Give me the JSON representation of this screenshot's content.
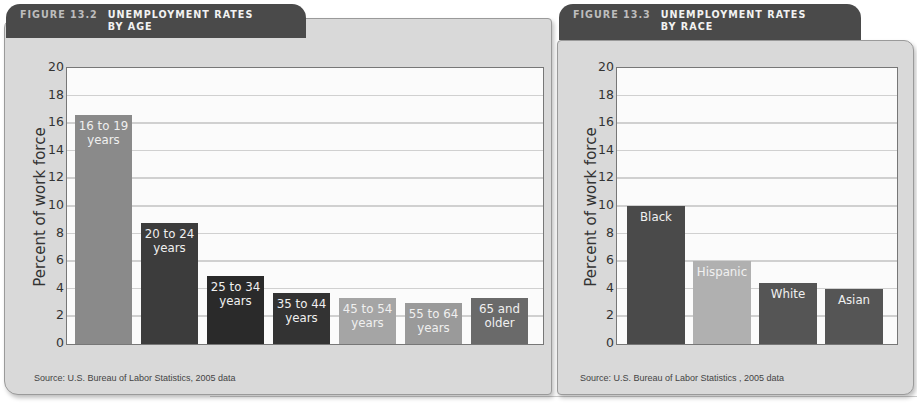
{
  "chart_data": [
    {
      "type": "bar",
      "title": "FIGURE 13.2  UNEMPLOYMENT RATES BY AGE",
      "figure_label": "FIGURE 13.2",
      "title_line1": "UNEMPLOYMENT RATES",
      "title_line2": "BY AGE",
      "xlabel": "",
      "ylabel": "Percent of work force",
      "ylim": [
        0,
        20
      ],
      "yticks": [
        "0",
        "2",
        "4",
        "6",
        "8",
        "10",
        "12",
        "14",
        "16",
        "18",
        "20"
      ],
      "grid": true,
      "categories": [
        "16 to 19 years",
        "20 to 24 years",
        "25 to 34 years",
        "35 to 44 years",
        "45 to 54 years",
        "55 to 64 years",
        "65 and older"
      ],
      "label_lines": [
        [
          "16 to 19",
          "years"
        ],
        [
          "20 to 24",
          "years"
        ],
        [
          "25 to 34",
          "years"
        ],
        [
          "35 to 44",
          "years"
        ],
        [
          "45 to 54",
          "years"
        ],
        [
          "55 to 64",
          "years"
        ],
        [
          "65 and",
          "older"
        ]
      ],
      "values": [
        16.6,
        8.8,
        4.9,
        3.7,
        3.3,
        3.0,
        3.3
      ],
      "colors": [
        "#8a8a8a",
        "#3c3c3c",
        "#2a2a2a",
        "#333333",
        "#a5a5a5",
        "#9a9a9a",
        "#6a6a6a"
      ],
      "source": "Source: U.S. Bureau of Labor Statistics, 2005 data"
    },
    {
      "type": "bar",
      "title": "FIGURE 13.3  UNEMPLOYMENT RATES BY RACE",
      "figure_label": "FIGURE 13.3",
      "title_line1": "UNEMPLOYMENT RATES",
      "title_line2": "BY RACE",
      "xlabel": "",
      "ylabel": "Percent of work force",
      "ylim": [
        0,
        20
      ],
      "yticks": [
        "0",
        "2",
        "4",
        "6",
        "8",
        "10",
        "12",
        "14",
        "16",
        "18",
        "20"
      ],
      "grid": true,
      "categories": [
        "Black",
        "Hispanic",
        "White",
        "Asian"
      ],
      "label_lines": [
        [
          "Black"
        ],
        [
          "Hispanic"
        ],
        [
          "White"
        ],
        [
          "Asian"
        ]
      ],
      "values": [
        10.0,
        6.0,
        4.4,
        4.0
      ],
      "colors": [
        "#4a4a4a",
        "#b0b0b0",
        "#555555",
        "#555555"
      ],
      "source": "Source: U.S. Bureau of Labor Statistics , 2005 data"
    }
  ]
}
